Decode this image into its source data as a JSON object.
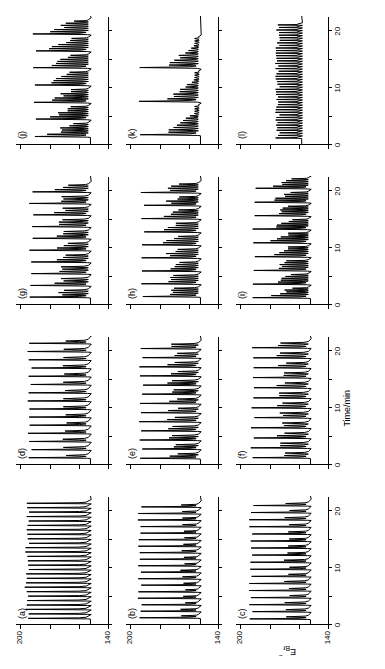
{
  "figure": {
    "axis_labels": {
      "y_main": "E",
      "y_main_sub": "Br",
      "y_main_sup": "−",
      "x_main": "Time/min"
    },
    "y_ticks": [
      "140",
      "",
      "",
      "200"
    ],
    "y_tick_values": [
      140,
      160,
      180,
      200
    ],
    "x_ticks": [
      "0",
      "",
      "10",
      "",
      "20"
    ],
    "x_tick_values": [
      0,
      5,
      10,
      15,
      20
    ],
    "ylim": [
      140,
      203
    ],
    "xlim": [
      0,
      22.5
    ],
    "stroke_color": "#000000",
    "background_color": "#ffffff"
  },
  "chart_data": {
    "type": "line",
    "title": "",
    "xlabel": "Time/min",
    "ylabel": "E_Br- ",
    "xlim": [
      0,
      22.5
    ],
    "ylim": [
      140,
      203
    ],
    "grid": false,
    "legend": "none",
    "panel_layout": {
      "rows": 4,
      "cols": 3,
      "order": [
        [
          "a",
          "d",
          "g",
          "j"
        ],
        [
          "b",
          "e",
          "h",
          "k"
        ],
        [
          "c",
          "f",
          "i",
          "l"
        ]
      ]
    },
    "panels": [
      {
        "label": "(a)",
        "row": 0,
        "col": 0,
        "description": "regular large-amplitude relaxation oscillations, constant period",
        "period_min": 0.78,
        "n_oscillations": 27,
        "baseline": 152,
        "peak": 197,
        "spike_width": 0.3,
        "start_time": 0.9,
        "small_shoulder": 0,
        "shoulder_amp": 0,
        "n_shoulder": 0
      },
      {
        "label": "(b)",
        "row": 1,
        "col": 0,
        "description": "mixed-mode oscillations: one large spike plus one small peak per cycle",
        "period_min": 1.15,
        "n_oscillations": 18,
        "baseline": 152,
        "peak": 195,
        "spike_width": 0.32,
        "start_time": 1.0,
        "small_shoulder": 1,
        "shoulder_amp": 12,
        "n_shoulder": 1
      },
      {
        "label": "(c)",
        "row": 2,
        "col": 0,
        "description": "mixed-mode oscillations with larger small-amplitude shoulder",
        "period_min": 1.25,
        "n_oscillations": 17,
        "baseline": 152,
        "peak": 194,
        "spike_width": 0.33,
        "start_time": 0.8,
        "small_shoulder": 1,
        "shoulder_amp": 16,
        "n_shoulder": 1
      },
      {
        "label": "(d)",
        "row": 0,
        "col": 1,
        "description": "mixed-mode 1^1 oscillations, longer period",
        "period_min": 1.45,
        "n_oscillations": 15,
        "baseline": 152,
        "peak": 195,
        "spike_width": 0.35,
        "start_time": 1.0,
        "small_shoulder": 1,
        "shoulder_amp": 18,
        "n_shoulder": 1
      },
      {
        "label": "(e)",
        "row": 1,
        "col": 1,
        "description": "mixed-mode 1^2 oscillations",
        "period_min": 1.6,
        "n_oscillations": 13,
        "baseline": 152,
        "peak": 194,
        "spike_width": 0.36,
        "start_time": 0.9,
        "small_shoulder": 1,
        "shoulder_amp": 20,
        "n_shoulder": 2
      },
      {
        "label": "(f)",
        "row": 2,
        "col": 1,
        "description": "mixed-mode 1^2 oscillations, slightly longer period",
        "period_min": 1.75,
        "n_oscillations": 12,
        "baseline": 152,
        "peak": 193,
        "spike_width": 0.36,
        "start_time": 1.0,
        "small_shoulder": 1,
        "shoulder_amp": 21,
        "n_shoulder": 2
      },
      {
        "label": "(g)",
        "row": 0,
        "col": 2,
        "description": "mixed-mode 1^3 oscillations",
        "period_min": 2.05,
        "n_oscillations": 10,
        "baseline": 152,
        "peak": 194,
        "spike_width": 0.38,
        "start_time": 1.1,
        "small_shoulder": 1,
        "shoulder_amp": 22,
        "n_shoulder": 3
      },
      {
        "label": "(h)",
        "row": 1,
        "col": 2,
        "description": "mixed-mode 1^4 oscillations",
        "period_min": 2.3,
        "n_oscillations": 9,
        "baseline": 152,
        "peak": 193,
        "spike_width": 0.38,
        "start_time": 1.2,
        "small_shoulder": 1,
        "shoulder_amp": 23,
        "n_shoulder": 4
      },
      {
        "label": "(i)",
        "row": 2,
        "col": 2,
        "description": "mixed-mode 1^5 oscillations with long small-amplitude trains",
        "period_min": 2.4,
        "n_oscillations": 9,
        "baseline": 152,
        "peak": 192,
        "spike_width": 0.38,
        "start_time": 1.0,
        "small_shoulder": 1,
        "shoulder_amp": 24,
        "n_shoulder": 5
      },
      {
        "label": "(j)",
        "row": 0,
        "col": 3,
        "description": "mixed-mode 1^6 oscillations, sparse large spikes",
        "period_min": 3.0,
        "n_oscillations": 7,
        "baseline": 152,
        "peak": 192,
        "spike_width": 0.4,
        "start_time": 1.2,
        "small_shoulder": 1,
        "shoulder_amp": 26,
        "n_shoulder": 6
      },
      {
        "label": "(k)",
        "row": 1,
        "col": 3,
        "description": "sparse large spikes, long small-amplitude oscillation trains",
        "period_min": 6.0,
        "n_oscillations": 3,
        "baseline": 152,
        "peak": 196,
        "spike_width": 0.45,
        "start_time": 1.5,
        "small_shoulder": 1,
        "shoulder_amp": 22,
        "n_shoulder": 12
      },
      {
        "label": "(l)",
        "row": 2,
        "col": 3,
        "description": "small-amplitude oscillations only, no large spikes",
        "period_min": 0.45,
        "n_oscillations": 45,
        "baseline": 158,
        "peak": 176,
        "spike_width": 0.22,
        "start_time": 1.0,
        "small_shoulder": 0,
        "shoulder_amp": 0,
        "n_shoulder": 0
      }
    ]
  }
}
